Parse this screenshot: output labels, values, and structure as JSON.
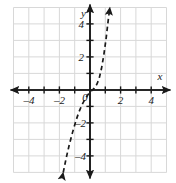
{
  "chart_data": {
    "type": "line",
    "title": "",
    "xlabel": "x",
    "ylabel": "y",
    "xlim": [
      -5,
      5
    ],
    "ylim": [
      -5,
      5
    ],
    "grid": true,
    "legend": null,
    "x_ticks": [
      -4,
      -2,
      0,
      2,
      4
    ],
    "x_tick_labels": [
      "–4",
      "–2",
      "0",
      "2",
      "4"
    ],
    "y_ticks": [
      4,
      2,
      -2,
      -4
    ],
    "y_tick_labels": [
      "4",
      "2",
      "–2",
      "–4"
    ],
    "origin_label": "0",
    "series": [
      {
        "name": "dashed-curve",
        "style": "dashed",
        "color": "#1a1a1a",
        "arrow_start": true,
        "arrow_end": true,
        "points": [
          [
            -1.75,
            -5.0
          ],
          [
            -1.55,
            -4.1
          ],
          [
            -1.35,
            -3.3
          ],
          [
            -1.15,
            -2.6
          ],
          [
            -0.95,
            -1.95
          ],
          [
            -0.75,
            -1.4
          ],
          [
            -0.55,
            -0.95
          ],
          [
            -0.35,
            -0.6
          ],
          [
            -0.15,
            -0.3
          ],
          [
            0.05,
            -0.1
          ],
          [
            0.25,
            0.08
          ],
          [
            0.45,
            0.35
          ],
          [
            0.6,
            0.7
          ],
          [
            0.75,
            1.3
          ],
          [
            0.9,
            2.1
          ],
          [
            1.05,
            3.1
          ],
          [
            1.2,
            4.3
          ],
          [
            1.3,
            5.0
          ]
        ]
      }
    ]
  },
  "axis": {
    "x_name": "x",
    "y_name": "y"
  }
}
